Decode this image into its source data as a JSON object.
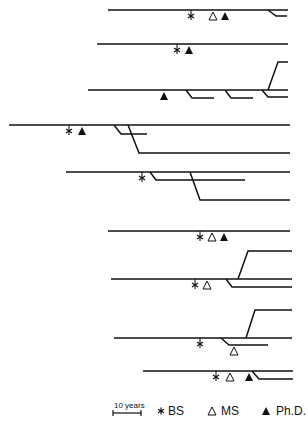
{
  "diagram": {
    "type": "career-timeline-lineage",
    "stroke_color": "#111111",
    "rows": [
      {
        "id": 1,
        "y": 10,
        "x_start": 108,
        "x_end": 288,
        "markers": [
          {
            "type": "BS",
            "x": 191
          },
          {
            "type": "MS",
            "x": 213
          },
          {
            "type": "PhD",
            "x": 225
          }
        ],
        "branches": [
          {
            "x0": 268,
            "x1": 276,
            "y": 16,
            "x_end": 287
          }
        ]
      },
      {
        "id": 2,
        "y": 44,
        "x_start": 97,
        "x_end": 288,
        "markers": [
          {
            "type": "BS",
            "x": 177
          },
          {
            "type": "PhD",
            "x": 189
          }
        ],
        "branches": []
      },
      {
        "id": 3,
        "y": 90,
        "x_start": 88,
        "x_end": 288,
        "markers": [
          {
            "type": "PhD",
            "x": 164
          }
        ],
        "branches": [
          {
            "x0": 186,
            "x1": 192,
            "y": 98,
            "x_end": 214
          },
          {
            "x0": 225,
            "x1": 231,
            "y": 98,
            "x_end": 253
          },
          {
            "x0": 262,
            "x1": 268,
            "y": 97,
            "x_end": 288
          },
          {
            "x0": 268,
            "x1": 278,
            "y": 62,
            "x_end": 288
          }
        ]
      },
      {
        "id": 4,
        "y": 125,
        "x_start": 9,
        "x_end": 290,
        "markers": [
          {
            "type": "BS",
            "x": 69
          },
          {
            "type": "PhD",
            "x": 82
          }
        ],
        "branches": [
          {
            "x0": 114,
            "x1": 121,
            "y": 134,
            "x_end": 147
          },
          {
            "x0": 128,
            "x1": 139,
            "y": 153,
            "x_end": 290
          }
        ]
      },
      {
        "id": 5,
        "y": 172,
        "x_start": 66,
        "x_end": 290,
        "markers": [
          {
            "type": "BS",
            "x": 142
          }
        ],
        "branches": [
          {
            "x0": 150,
            "x1": 156,
            "y": 180,
            "x_end": 245
          },
          {
            "x0": 190,
            "x1": 200,
            "y": 200,
            "x_end": 290
          }
        ]
      },
      {
        "id": 6,
        "y": 231,
        "x_start": 108,
        "x_end": 290,
        "markers": [
          {
            "type": "BS",
            "x": 200
          },
          {
            "type": "MS",
            "x": 212
          },
          {
            "type": "PhD",
            "x": 224
          }
        ],
        "branches": []
      },
      {
        "id": 7,
        "y": 279,
        "x_start": 111,
        "x_end": 292,
        "markers": [
          {
            "type": "BS",
            "x": 195
          },
          {
            "type": "MS",
            "x": 207
          }
        ],
        "branches": [
          {
            "x0": 226,
            "x1": 232,
            "y": 287,
            "x_end": 292
          },
          {
            "x0": 238,
            "x1": 248,
            "y": 251,
            "x_end": 292
          }
        ]
      },
      {
        "id": 8,
        "y": 338,
        "x_start": 114,
        "x_end": 292,
        "markers": [
          {
            "type": "BS",
            "x": 200
          },
          {
            "type": "MS",
            "x": 234,
            "y": 345
          }
        ],
        "branches": [
          {
            "x0": 221,
            "x1": 229,
            "y": 345,
            "x_end": 268
          },
          {
            "x0": 246,
            "x1": 255,
            "y": 310,
            "x_end": 292
          }
        ]
      },
      {
        "id": 9,
        "y": 371,
        "x_start": 143,
        "x_end": 293,
        "markers": [
          {
            "type": "BS",
            "x": 216
          },
          {
            "type": "MS",
            "x": 230
          },
          {
            "type": "PhD",
            "x": 249
          }
        ],
        "branches": [
          {
            "x0": 252,
            "x1": 259,
            "y": 379,
            "x_end": 293
          }
        ]
      }
    ]
  },
  "legend": {
    "scale_bar": {
      "label": "10 years",
      "x0": 113,
      "x1": 141,
      "y": 413
    },
    "items": [
      {
        "symbol": "asterisk",
        "glyph": "*",
        "label": "BS"
      },
      {
        "symbol": "open-triangle",
        "glyph": "△",
        "label": "MS"
      },
      {
        "symbol": "filled-triangle",
        "glyph": "▲",
        "label": "Ph.D."
      }
    ]
  }
}
